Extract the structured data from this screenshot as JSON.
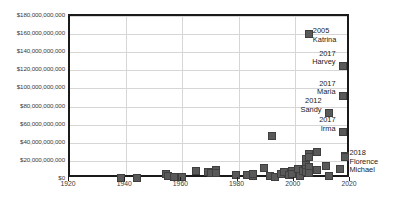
{
  "chart_data": {
    "type": "scatter",
    "title": "",
    "subtitle": "",
    "xlabel": "",
    "ylabel": "",
    "xlim": [
      1920,
      2020
    ],
    "ylim": [
      0,
      180000000000
    ],
    "grid": true,
    "legend": "none",
    "marker_color": "#595959",
    "gridline_color": "#d6d6d6",
    "axis_color": "#1a1a1a",
    "x_ticks": [
      1920,
      1940,
      1960,
      1980,
      2000,
      2020
    ],
    "x_tick_labels": [
      "1920",
      "1940",
      "1960",
      "1980",
      "2000",
      "2020"
    ],
    "y_ticks": [
      0,
      20000000000,
      40000000000,
      60000000000,
      80000000000,
      100000000000,
      120000000000,
      140000000000,
      160000000000,
      180000000000
    ],
    "y_tick_labels": [
      "$0",
      "$20,000,000,000",
      "$40,000,000,000",
      "$60,000,000,000",
      "$80,000,000,000",
      "$100,000,000,000",
      "$120,000,000,000",
      "$140,000,000,000",
      "$160,000,000,000",
      "$180,000,000,000"
    ],
    "points": [
      {
        "x": 1938,
        "y": 1600000000
      },
      {
        "x": 1944,
        "y": 1500000000
      },
      {
        "x": 1954,
        "y": 5800000000
      },
      {
        "x": 1955,
        "y": 3500000000
      },
      {
        "x": 1957,
        "y": 1700000000
      },
      {
        "x": 1960,
        "y": 2100000000
      },
      {
        "x": 1965,
        "y": 9000000000
      },
      {
        "x": 1969,
        "y": 7500000000
      },
      {
        "x": 1970,
        "y": 6200000000
      },
      {
        "x": 1972,
        "y": 9500000000
      },
      {
        "x": 1972,
        "y": 7000000000
      },
      {
        "x": 1979,
        "y": 4000000000
      },
      {
        "x": 1983,
        "y": 4400000000
      },
      {
        "x": 1985,
        "y": 3000000000
      },
      {
        "x": 1985,
        "y": 5200000000
      },
      {
        "x": 1989,
        "y": 12000000000
      },
      {
        "x": 1991,
        "y": 3200000000
      },
      {
        "x": 1992,
        "y": 48000000000
      },
      {
        "x": 1993,
        "y": 2500000000
      },
      {
        "x": 1995,
        "y": 6000000000
      },
      {
        "x": 1996,
        "y": 7800000000
      },
      {
        "x": 1998,
        "y": 4500000000
      },
      {
        "x": 1999,
        "y": 9000000000
      },
      {
        "x": 1999,
        "y": 5000000000
      },
      {
        "x": 2001,
        "y": 11000000000
      },
      {
        "x": 2002,
        "y": 3500000000
      },
      {
        "x": 2003,
        "y": 8500000000
      },
      {
        "x": 2004,
        "y": 22000000000
      },
      {
        "x": 2004,
        "y": 16000000000
      },
      {
        "x": 2004,
        "y": 11500000000
      },
      {
        "x": 2004,
        "y": 7500000000
      },
      {
        "x": 2005,
        "y": 160000000000
      },
      {
        "x": 2005,
        "y": 28000000000
      },
      {
        "x": 2005,
        "y": 24000000000
      },
      {
        "x": 2005,
        "y": 13000000000
      },
      {
        "x": 2005,
        "y": 6500000000
      },
      {
        "x": 2008,
        "y": 30000000000
      },
      {
        "x": 2008,
        "y": 10000000000
      },
      {
        "x": 2011,
        "y": 14000000000
      },
      {
        "x": 2012,
        "y": 73000000000
      },
      {
        "x": 2012,
        "y": 3000000000
      },
      {
        "x": 2016,
        "y": 11000000000
      },
      {
        "x": 2017,
        "y": 125000000000
      },
      {
        "x": 2017,
        "y": 92000000000
      },
      {
        "x": 2017,
        "y": 52000000000
      },
      {
        "x": 2018,
        "y": 25000000000
      },
      {
        "x": 2018,
        "y": 24000000000
      }
    ],
    "annotations": [
      {
        "id": "katrina",
        "lines": [
          "2005",
          "Katrina"
        ],
        "x": 2005,
        "y": 160000000000,
        "align": "left"
      },
      {
        "id": "harvey",
        "lines": [
          "2017",
          "Harvey"
        ],
        "x": 2017,
        "y": 125000000000,
        "align": "right"
      },
      {
        "id": "maria",
        "lines": [
          "2017",
          "Maria"
        ],
        "x": 2017,
        "y": 92000000000,
        "align": "right"
      },
      {
        "id": "sandy",
        "lines": [
          "2012",
          "Sandy"
        ],
        "x": 2012,
        "y": 73000000000,
        "align": "right"
      },
      {
        "id": "irma",
        "lines": [
          "2017",
          "Irma"
        ],
        "x": 2017,
        "y": 52000000000,
        "align": "right"
      },
      {
        "id": "florence-michael",
        "lines": [
          "2018",
          "Florence",
          "Michael"
        ],
        "x": 2018,
        "y": 25000000000,
        "align": "left"
      }
    ]
  }
}
